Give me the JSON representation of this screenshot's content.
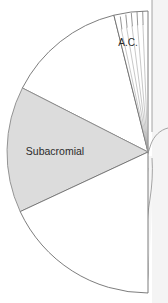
{
  "figure": {
    "type": "anatomical-fan-diagram",
    "background_color": "#ffffff",
    "width": 168,
    "height": 303
  },
  "geometry": {
    "apex": {
      "x": 148,
      "y": 152
    },
    "radius": 141,
    "arc_start_angle_deg": -90,
    "arc_end_angle_deg": 90,
    "note": "semicircular arc opening to the left from a vertical top point to a vertical bottom point"
  },
  "regions": [
    {
      "id": "white-upper",
      "label": "",
      "fill": "#ffffff",
      "stroke": "#6e6e6e",
      "start_angle_deg": -76,
      "end_angle_deg": -27,
      "shaded": false
    },
    {
      "id": "subacromial",
      "label": "Subacromial",
      "fill": "#dcdcdc",
      "stroke": "#8a8a8a",
      "start_angle_deg": -27,
      "end_angle_deg": 25,
      "shaded": true,
      "label_x": 55,
      "label_y": 152
    },
    {
      "id": "white-lower",
      "label": "",
      "fill": "#ffffff",
      "stroke": "#6e6e6e",
      "start_angle_deg": 25,
      "end_angle_deg": 90,
      "shaded": false
    },
    {
      "id": "acromioclavicular",
      "label": "A.C.",
      "fill": "#ffffff",
      "stroke": "#6e6e6e",
      "start_angle_deg": -90,
      "end_angle_deg": -76,
      "shaded": false,
      "label_x": 127,
      "label_y": 43,
      "tick_count": 5,
      "tick_inner_radius": 128,
      "tick_outer_radius": 141
    }
  ],
  "labels": {
    "subacromial": "Subacromial",
    "acromioclavicular": "A.C."
  },
  "anatomy": {
    "name": "arm-and-torso-silhouette",
    "stroke": "#8f8f8f",
    "fill": "#f2f2f2",
    "parts": [
      "torso-edge",
      "shoulder-contour",
      "upper-arm-outline",
      "forearm-outline",
      "hand-with-fingers"
    ]
  },
  "colors": {
    "shaded_wedge": "#dcdcdc",
    "wedge_outline": "#6e6e6e",
    "shaded_outline": "#8a8a8a",
    "anatomy_line": "#8f8f8f",
    "anatomy_fill": "#f2f2f2",
    "text": "#2b2b2b",
    "background": "#ffffff"
  }
}
